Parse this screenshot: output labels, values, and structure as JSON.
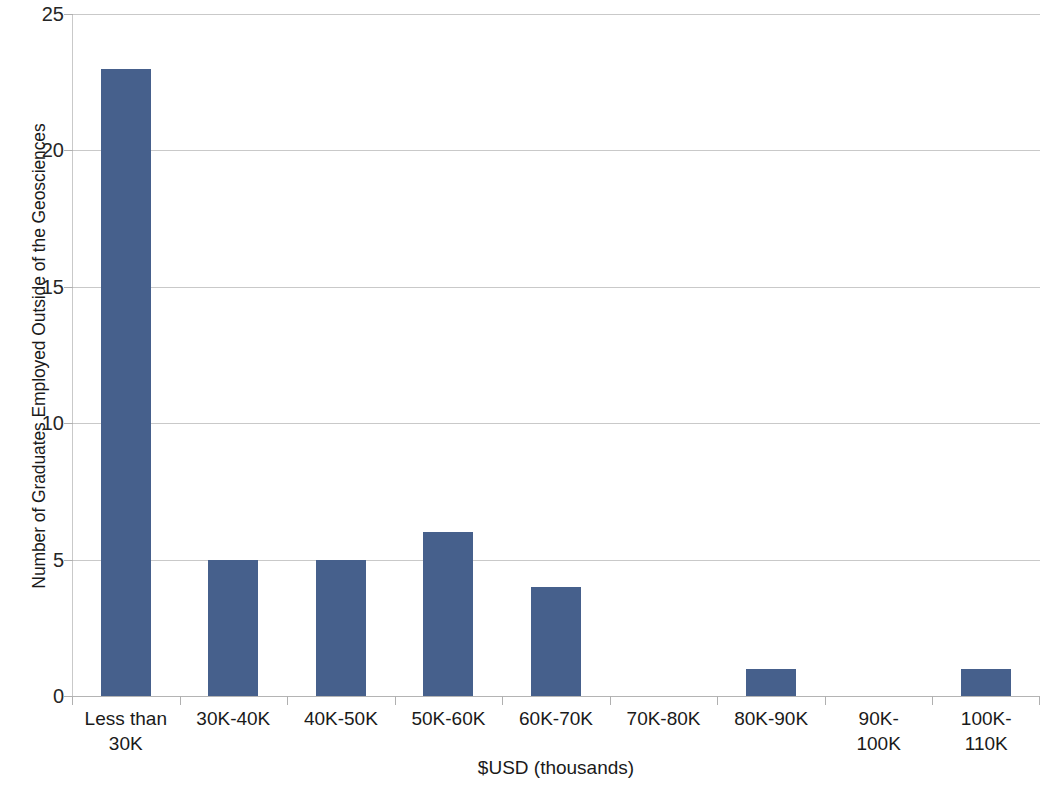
{
  "chart_data": {
    "type": "bar",
    "title": "",
    "subtitle": "",
    "xlabel": "$USD (thousands)",
    "ylabel": "Number of Graduates Employed Outside of the Geosciences",
    "categories": [
      "Less than 30K",
      "30K-40K",
      "40K-50K",
      "50K-60K",
      "60K-70K",
      "70K-80K",
      "80K-90K",
      "90K-100K",
      "100K-110K"
    ],
    "category_lines": [
      [
        "Less than",
        "30K"
      ],
      [
        "30K-40K",
        ""
      ],
      [
        "40K-50K",
        ""
      ],
      [
        "50K-60K",
        ""
      ],
      [
        "60K-70K",
        ""
      ],
      [
        "70K-80K",
        ""
      ],
      [
        "80K-90K",
        ""
      ],
      [
        "90K-",
        "100K"
      ],
      [
        "100K-",
        "110K"
      ]
    ],
    "values": [
      23,
      5,
      5,
      6,
      4,
      0,
      1,
      0,
      1
    ],
    "ylim": [
      0,
      25
    ],
    "yticks": [
      0,
      5,
      10,
      15,
      20,
      25
    ],
    "ytick_labels": [
      "0",
      "5",
      "10",
      "15",
      "20",
      "25"
    ],
    "grid": true,
    "grid_axis": "y",
    "legend": false,
    "legend_position": "none",
    "series": [
      {
        "name": "Graduates",
        "values": [
          23,
          5,
          5,
          6,
          4,
          0,
          1,
          0,
          1
        ]
      }
    ],
    "colors": {
      "bar": "#46608C",
      "gridline": "#C9C9C9",
      "axis": "#B4B4B4",
      "text": "#1A1A1A",
      "background": "#FFFFFF"
    }
  }
}
